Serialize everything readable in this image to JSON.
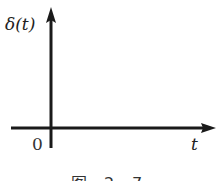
{
  "diagram": {
    "y_label": "δ(t)",
    "x_label": "t",
    "origin_label": "0",
    "caption": "图 2-7",
    "line_color": "#1a1a1a"
  }
}
